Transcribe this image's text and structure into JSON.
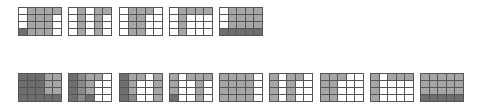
{
  "legend": {
    "w": "white",
    "g": "gray",
    "m": "medium-gray",
    "d": "dark"
  },
  "top_row": {
    "y": 7,
    "grids": [
      {
        "x": 18,
        "cells": [
          "wgggg",
          "wgggw",
          "wgggw",
          "dgggw"
        ]
      },
      {
        "x": 68,
        "cells": [
          "wgwgg",
          "wgwgw",
          "wgwgw",
          "wgwgw"
        ]
      },
      {
        "x": 119,
        "cells": [
          "wgggw",
          "wggww",
          "wggww",
          "wggww"
        ]
      },
      {
        "x": 169,
        "cells": [
          "wgggg",
          "wgwww",
          "wgwww",
          "wgwww"
        ]
      },
      {
        "x": 219,
        "cells": [
          "wgggg",
          "wgggg",
          "wgggg",
          "ddddd"
        ]
      }
    ]
  },
  "bottom_row": {
    "y": 73,
    "grids": [
      {
        "x": 18,
        "cells": [
          "dddgg",
          "dddgg",
          "dddgg",
          "ddddd"
        ]
      },
      {
        "x": 68,
        "cells": [
          "dmggw",
          "dmgww",
          "dmgww",
          "dmdww"
        ]
      },
      {
        "x": 119,
        "cells": [
          "dggwg",
          "dgwwg",
          "dgwwg",
          "dmwwg"
        ]
      },
      {
        "x": 169,
        "cells": [
          "gwggg",
          "gwwgw",
          "gwwgw",
          "dwwgw"
        ]
      },
      {
        "x": 219,
        "cells": [
          "ggggw",
          "ggggw",
          "ggggw",
          "ggggw"
        ]
      },
      {
        "x": 269,
        "cells": [
          "gwggw",
          "gwgww",
          "gwgww",
          "gwgww"
        ]
      },
      {
        "x": 320,
        "cells": [
          "gggww",
          "ggwww",
          "ggwww",
          "ggwww"
        ]
      },
      {
        "x": 370,
        "cells": [
          "gwggg",
          "gwwww",
          "gwwww",
          "gwwww"
        ]
      },
      {
        "x": 420,
        "cells": [
          "ggggg",
          "ggggg",
          "ggggg",
          "ddddd"
        ]
      }
    ]
  }
}
